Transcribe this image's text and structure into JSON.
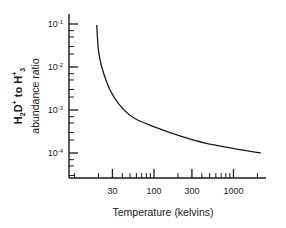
{
  "chart_data": {
    "type": "line",
    "title": "",
    "xlabel": "Temperature (kelvins)",
    "ylabel": "H2D+ to H3+ abundance ratio",
    "ylabel_line1": "H₂D⁺ to H₃⁺",
    "ylabel_line2": "abundance ratio",
    "x_scale": "log",
    "y_scale": "log",
    "xlim": [
      8.4,
      2200
    ],
    "ylim": [
      2.5e-05,
      0.12
    ],
    "x_ticks": [
      30,
      100,
      300,
      1000
    ],
    "x_tick_labels": [
      "30",
      "100",
      "300",
      "1000"
    ],
    "y_ticks": [
      0.1,
      0.01,
      0.001,
      0.0001
    ],
    "y_tick_labels": [
      {
        "base": "10",
        "exp": "-1"
      },
      {
        "base": "10",
        "exp": "-2"
      },
      {
        "base": "10",
        "exp": "-3"
      },
      {
        "base": "10",
        "exp": "-4"
      }
    ],
    "grid": false,
    "legend": null,
    "series": [
      {
        "name": "H2D+/H3+ ratio",
        "color": "#1a1a1a",
        "x": [
          19,
          20,
          22,
          28,
          37,
          56,
          103,
          212,
          440,
          1200,
          2200
        ],
        "values": [
          0.095,
          0.025,
          0.01,
          0.0029,
          0.0013,
          0.00065,
          0.0004,
          0.00025,
          0.00017,
          0.00012,
          0.0001
        ]
      }
    ]
  }
}
